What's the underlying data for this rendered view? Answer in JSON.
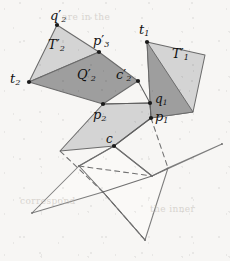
{
  "figure": {
    "name": "folded-polygon-construction",
    "background": "#f7f6f4",
    "width": 230,
    "height": 261
  },
  "colors": {
    "fill_light": "#d4d4d4",
    "fill_dark": "#9e9e9e",
    "stroke": "#4a4a4a",
    "stroke_light": "#8d8d8d",
    "vertex": "#1a1a1a",
    "label": "#111111"
  },
  "labels": [
    {
      "id": "q2p",
      "base": "q",
      "sub": "2",
      "prime": true,
      "x": 50,
      "y": 9,
      "size": "s13"
    },
    {
      "id": "T2p",
      "base": "T",
      "sub": "2",
      "prime": true,
      "x": 48,
      "y": 38,
      "size": "s13"
    },
    {
      "id": "p3p",
      "base": "p",
      "sub": "3",
      "prime": true,
      "x": 93,
      "y": 34,
      "size": "s13"
    },
    {
      "id": "t1",
      "base": "t",
      "sub": "1",
      "prime": false,
      "x": 139,
      "y": 23,
      "size": "s13"
    },
    {
      "id": "T1p",
      "base": "T",
      "sub": "1",
      "prime": true,
      "x": 172,
      "y": 47,
      "size": "s13"
    },
    {
      "id": "t2",
      "base": "t",
      "sub": "2",
      "prime": false,
      "x": 10,
      "y": 72,
      "size": "s13"
    },
    {
      "id": "Q2p",
      "base": "Q",
      "sub": "2",
      "prime": true,
      "x": 77,
      "y": 68,
      "size": "s13"
    },
    {
      "id": "c2p",
      "base": "c",
      "sub": "2",
      "prime": true,
      "x": 116,
      "y": 68,
      "size": "s13"
    },
    {
      "id": "q1",
      "base": "q",
      "sub": "1",
      "prime": false,
      "x": 155,
      "y": 93,
      "size": "s12"
    },
    {
      "id": "p2",
      "base": "p",
      "sub": "2",
      "prime": false,
      "x": 93,
      "y": 108,
      "size": "s13"
    },
    {
      "id": "p1",
      "base": "p",
      "sub": "1",
      "prime": false,
      "x": 155,
      "y": 110,
      "size": "s13"
    },
    {
      "id": "c",
      "base": "c",
      "sub": "",
      "prime": false,
      "x": 106,
      "y": 133,
      "size": "s12"
    }
  ],
  "vertices": [
    {
      "name": "vertex-q2-prime",
      "x": 57,
      "y": 25
    },
    {
      "name": "vertex-p3-prime",
      "x": 99,
      "y": 52
    },
    {
      "name": "vertex-t1",
      "x": 147,
      "y": 42
    },
    {
      "name": "vertex-t2",
      "x": 29,
      "y": 82
    },
    {
      "name": "vertex-c2-prime",
      "x": 138,
      "y": 81
    },
    {
      "name": "vertex-q1",
      "x": 150,
      "y": 103
    },
    {
      "name": "vertex-p2",
      "x": 103,
      "y": 104
    },
    {
      "name": "vertex-p1",
      "x": 151,
      "y": 118
    },
    {
      "name": "vertex-c",
      "x": 114,
      "y": 146
    }
  ],
  "shapes": {
    "T2_prime": {
      "points": "29,82 57,25 99,52",
      "fill": "light"
    },
    "Q2_prime": {
      "points": "29,82 99,52 138,81 103,104",
      "fill": "dark"
    },
    "T1_prime_light": {
      "points": "147,42 205,55 193,112 151,118",
      "fill": "light"
    },
    "T1_prime_dark": {
      "points": "147,42 193,112 151,118",
      "fill": "dark"
    },
    "lower_light_quad": {
      "points": "103,104 150,103 151,118 114,146 60,151",
      "fill": "light"
    }
  },
  "star": {
    "outline": "114,146 152,176 222,144 168,168 145,240 103,192 32,213 79,166",
    "tips": [
      {
        "name": "star-tip-right",
        "x": 222,
        "y": 144
      },
      {
        "name": "star-tip-bottom",
        "x": 145,
        "y": 240
      },
      {
        "name": "star-tip-left",
        "x": 32,
        "y": 213
      }
    ],
    "inner": [
      {
        "name": "star-inner-upper-right",
        "x": 152,
        "y": 176
      },
      {
        "name": "star-inner-lower",
        "x": 103,
        "y": 192
      },
      {
        "name": "star-inner-upper-left",
        "x": 79,
        "y": 166
      }
    ],
    "solid_creases": [
      "114,146 152,176",
      "114,146 79,166",
      "152,176 103,192",
      "79,166 103,192",
      "152,176 168,168",
      "103,192 145,240"
    ],
    "dashed_creases": [
      "151,118 168,168",
      "79,166 152,176",
      "103,192 60,151",
      "145,240 103,192"
    ]
  },
  "ghost_text": [
    {
      "text": "are in the",
      "x": 62,
      "y": 12
    },
    {
      "text": "correspond",
      "x": 20,
      "y": 196
    },
    {
      "text": "the inner",
      "x": 150,
      "y": 204
    }
  ]
}
